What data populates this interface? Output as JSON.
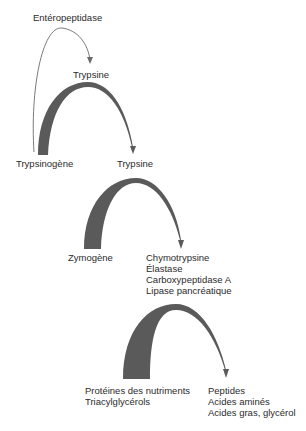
{
  "diagram": {
    "nodes": {
      "enteropeptidase": "Entéropeptidase",
      "trypsine_top": "Trypsine",
      "trypsinogene": "Trypsinogène",
      "trypsine_mid": "Trypsine",
      "zymogene": "Zymogène",
      "enzymes": [
        "Chymotrypsine",
        "Élastase",
        "Carboxypeptidase A",
        "Lipase pancréatique"
      ],
      "substrates": [
        "Protéines des nutriments",
        "Triacylglycérols"
      ],
      "products": [
        "Peptides",
        "Acides aminés",
        "Acides gras, glycérol"
      ]
    },
    "colors": {
      "arc_fill": "#5a5a5a",
      "thin_line": "#777777",
      "text": "#2b2b2b",
      "background": "#ffffff"
    },
    "edges": [
      {
        "from": "Trypsinogène",
        "to": "Trypsine",
        "catalyst": "Entéropeptidase"
      },
      {
        "from": "Trypsinogène",
        "to": "Trypsine",
        "catalyst": "Trypsine"
      },
      {
        "from": "Zymogène",
        "to": "Chymotrypsine / Élastase / Carboxypeptidase A / Lipase pancréatique",
        "catalyst": "Trypsine"
      },
      {
        "from": "Protéines des nutriments / Triacylglycérols",
        "to": "Peptides / Acides aminés / Acides gras, glycérol",
        "catalyst": "Chymotrypsine / Élastase / Carboxypeptidase A / Lipase pancréatique"
      }
    ]
  }
}
